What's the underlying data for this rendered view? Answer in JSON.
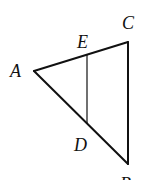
{
  "diagram": {
    "type": "triangle",
    "stroke_color": "#111111",
    "points": {
      "A": {
        "label": "A",
        "x": 34,
        "y": 71,
        "lx": 10,
        "ly": 77
      },
      "C": {
        "label": "C",
        "x": 128,
        "y": 42,
        "lx": 122,
        "ly": 29
      },
      "B": {
        "label": "B",
        "x": 128,
        "y": 164,
        "lx": 120,
        "ly": 190
      },
      "E": {
        "label": "E",
        "x": 87,
        "y": 55,
        "lx": 77,
        "ly": 48
      },
      "D": {
        "label": "D",
        "x": 87,
        "y": 123,
        "lx": 74,
        "ly": 151
      }
    },
    "segments": [
      {
        "from": "A",
        "to": "C",
        "width": 2
      },
      {
        "from": "C",
        "to": "B",
        "width": 2
      },
      {
        "from": "A",
        "to": "B",
        "width": 2
      },
      {
        "from": "E",
        "to": "D",
        "width": 1.2
      }
    ]
  }
}
